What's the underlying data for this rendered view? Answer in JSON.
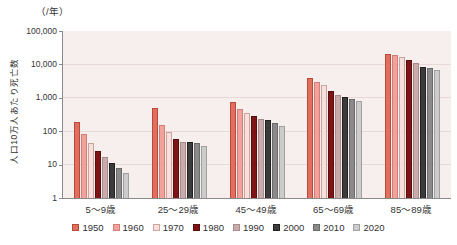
{
  "chart_data": {
    "type": "bar",
    "title": "",
    "unit_label": "（/年）",
    "ylabel": "人口10万人あたり死亡数",
    "yscale": "log",
    "ylim": [
      1,
      100000
    ],
    "ytick_labels": [
      "100,000",
      "10,000",
      "1,000",
      "100",
      "10",
      "1"
    ],
    "grid": true,
    "legend_position": "bottom",
    "plot_bg": "#f7eeee",
    "grid_color": "#e9d8d8",
    "axis_color": "#8a8a8a",
    "categories": [
      "5〜9歳",
      "25〜29歳",
      "45〜49歳",
      "65〜69歳",
      "85〜89歳"
    ],
    "series": [
      {
        "name": "1950",
        "color": "#e26e5e",
        "border": "#b84a3c",
        "values": [
          190,
          480,
          750,
          4000,
          20000
        ]
      },
      {
        "name": "1960",
        "color": "#f2a29b",
        "border": "#d07f78",
        "values": [
          80,
          150,
          450,
          3000,
          19000
        ]
      },
      {
        "name": "1970",
        "color": "#f9dfdb",
        "border": "#c9a5a0",
        "values": [
          45,
          95,
          360,
          2400,
          16500
        ]
      },
      {
        "name": "1980",
        "color": "#7e1416",
        "border": "#5a0e10",
        "values": [
          25,
          58,
          290,
          1550,
          14000
        ]
      },
      {
        "name": "1990",
        "color": "#c9abab",
        "border": "#a68c8c",
        "values": [
          17,
          48,
          230,
          1200,
          11000
        ]
      },
      {
        "name": "2000",
        "color": "#3b3b3b",
        "border": "#222222",
        "values": [
          11,
          47,
          215,
          1050,
          8500
        ]
      },
      {
        "name": "2010",
        "color": "#8a8a8a",
        "border": "#6b6b6b",
        "values": [
          8,
          45,
          175,
          950,
          7800
        ]
      },
      {
        "name": "2020",
        "color": "#cccccc",
        "border": "#a0a0a0",
        "values": [
          5.5,
          36,
          140,
          800,
          7000
        ]
      }
    ]
  }
}
